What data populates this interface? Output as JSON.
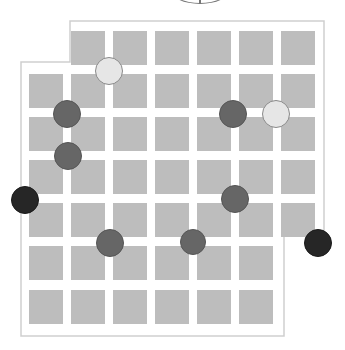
{
  "game": {
    "type": "board-game",
    "board": {
      "outline_color": "#cfcfcf",
      "background": "#ffffff",
      "outline": [
        [
          70,
          21
        ],
        [
          324,
          21
        ],
        [
          324,
          234
        ],
        [
          284,
          234
        ],
        [
          284,
          336
        ],
        [
          21,
          336
        ],
        [
          21,
          62
        ],
        [
          70,
          62
        ]
      ],
      "tile_color": "#bdbdbd",
      "tile_size": 34,
      "col_x": [
        29,
        71,
        113,
        155,
        197,
        239,
        281
      ],
      "row_y": [
        31,
        74,
        117,
        160,
        203,
        246,
        290
      ],
      "rows": [
        {
          "row": 0,
          "cols": [
            1,
            2,
            3,
            4,
            5,
            6
          ]
        },
        {
          "row": 1,
          "cols": [
            0,
            1,
            2,
            3,
            4,
            5,
            6
          ]
        },
        {
          "row": 2,
          "cols": [
            0,
            1,
            2,
            3,
            4,
            5,
            6
          ]
        },
        {
          "row": 3,
          "cols": [
            0,
            1,
            2,
            3,
            4,
            5,
            6
          ]
        },
        {
          "row": 4,
          "cols": [
            0,
            1,
            2,
            3,
            4,
            5,
            6
          ]
        },
        {
          "row": 5,
          "cols": [
            0,
            1,
            2,
            3,
            4,
            5
          ]
        },
        {
          "row": 6,
          "cols": [
            0,
            1,
            2,
            3,
            4,
            5
          ]
        }
      ]
    },
    "piece_colors": {
      "light": {
        "fill": "#e6e6e6",
        "stroke": "#8a8a8a"
      },
      "gray": {
        "fill": "#666666",
        "stroke": "#555555"
      },
      "black": {
        "fill": "#262626",
        "stroke": "#1a1a1a"
      }
    },
    "pieces": [
      {
        "kind": "light",
        "cx": 109,
        "cy": 71,
        "r": 14
      },
      {
        "kind": "gray",
        "cx": 67,
        "cy": 114,
        "r": 14
      },
      {
        "kind": "gray",
        "cx": 233,
        "cy": 114,
        "r": 14
      },
      {
        "kind": "light",
        "cx": 276,
        "cy": 114,
        "r": 14
      },
      {
        "kind": "gray",
        "cx": 68,
        "cy": 156,
        "r": 14
      },
      {
        "kind": "black",
        "cx": 25,
        "cy": 200,
        "r": 14
      },
      {
        "kind": "gray",
        "cx": 235,
        "cy": 199,
        "r": 14
      },
      {
        "kind": "gray",
        "cx": 110,
        "cy": 243,
        "r": 14
      },
      {
        "kind": "gray",
        "cx": 193,
        "cy": 242,
        "r": 13
      },
      {
        "kind": "black",
        "cx": 318,
        "cy": 243,
        "r": 14
      }
    ],
    "top_indicator": {
      "shape": "partial-circle-dial",
      "cx": 200
    }
  }
}
